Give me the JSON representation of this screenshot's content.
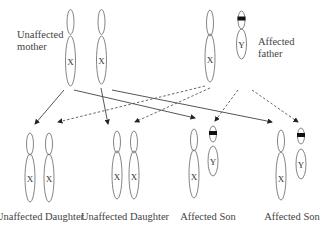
{
  "parents": {
    "mother": {
      "label_line1": "Unaffected",
      "label_line2": "mother",
      "chromosomes": [
        "X",
        "X"
      ]
    },
    "father": {
      "label_line1": "Affected",
      "label_line2": "father",
      "chromosomes": [
        "X",
        "Y"
      ],
      "marked": "Y"
    }
  },
  "offspring": [
    {
      "label": "Unaffected Daughter",
      "chromosomes": [
        "X",
        "X"
      ]
    },
    {
      "label": "Unaffected Daughter",
      "chromosomes": [
        "X",
        "X"
      ]
    },
    {
      "label": "Affected Son",
      "chromosomes": [
        "X",
        "Y"
      ],
      "marked": "Y"
    },
    {
      "label": "Affected Son",
      "chromosomes": [
        "X",
        "Y"
      ],
      "marked": "Y"
    }
  ],
  "legend": {
    "solid_arrow": "maternal inheritance",
    "dashed_arrow": "paternal inheritance"
  }
}
